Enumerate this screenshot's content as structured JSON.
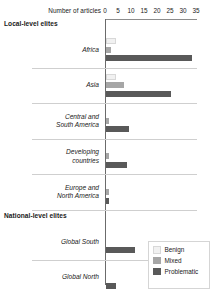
{
  "chart_data": {
    "type": "bar",
    "orientation": "horizontal",
    "title": "",
    "xlabel": "Number of articles",
    "ylabel": "",
    "xlim": [
      0,
      35
    ],
    "xticks": [
      0,
      5,
      10,
      15,
      20,
      25,
      30,
      35
    ],
    "grid": false,
    "legend_position": "bottom-right",
    "series": [
      {
        "name": "Benign",
        "color": "#f1f1f1"
      },
      {
        "name": "Mixed",
        "color": "#a6a6a6"
      },
      {
        "name": "Problematic",
        "color": "#595959"
      }
    ],
    "sections": [
      {
        "heading": "Local-level elites",
        "categories": [
          {
            "label": "Africa",
            "values": {
              "Benign": 4,
              "Mixed": 2,
              "Problematic": 33
            }
          },
          {
            "label": "Asia",
            "values": {
              "Benign": 4,
              "Mixed": 7,
              "Problematic": 25
            }
          },
          {
            "label": "Central and South America",
            "values": {
              "Benign": 0,
              "Mixed": 1,
              "Problematic": 9
            }
          },
          {
            "label": "Developing countries",
            "values": {
              "Benign": 0,
              "Mixed": 1,
              "Problematic": 8
            }
          },
          {
            "label": "Europe and North America",
            "values": {
              "Benign": 0,
              "Mixed": 1,
              "Problematic": 1
            }
          }
        ]
      },
      {
        "heading": "National-level elites",
        "categories": [
          {
            "label": "Global South",
            "values": {
              "Benign": 0,
              "Mixed": 0,
              "Problematic": 11
            }
          },
          {
            "label": "Global North",
            "values": {
              "Benign": 0,
              "Mixed": 0,
              "Problematic": 4
            }
          }
        ]
      },
      {
        "heading": "NGOs and donors",
        "categories": []
      }
    ]
  },
  "legend": {
    "items": [
      {
        "label": "Benign"
      },
      {
        "label": "Mixed"
      },
      {
        "label": "Problematic"
      }
    ]
  }
}
